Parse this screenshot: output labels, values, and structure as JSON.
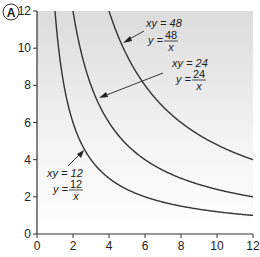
{
  "panel_label": "A",
  "chart_data": {
    "type": "line",
    "title": "",
    "xlabel": "",
    "ylabel": "",
    "xlim": [
      0,
      12
    ],
    "ylim": [
      0,
      12
    ],
    "x_ticks": [
      "0",
      "2",
      "4",
      "6",
      "8",
      "10",
      "12"
    ],
    "y_ticks": [
      "0",
      "2",
      "4",
      "6",
      "8",
      "10",
      "12"
    ],
    "grid": false,
    "background": "vertical gradient grey (top) to white (bottom)",
    "series": [
      {
        "name": "xy = 12",
        "equation": "y = 12/x",
        "k": 12
      },
      {
        "name": "xy = 24",
        "equation": "y = 24/x",
        "k": 24
      },
      {
        "name": "xy = 48",
        "equation": "y = 48/x",
        "k": 48
      }
    ],
    "annotations": [
      {
        "series": "xy = 48",
        "line1": "xy = 48",
        "num": "48",
        "den": "x"
      },
      {
        "series": "xy = 24",
        "line1": "xy = 24",
        "num": "24",
        "den": "x"
      },
      {
        "series": "xy = 12",
        "line1": "xy = 12",
        "num": "12",
        "den": "x"
      }
    ]
  }
}
